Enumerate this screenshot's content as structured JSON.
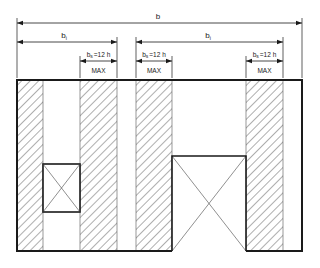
{
  "diagram": {
    "type": "wall-elevation-shear-panel-dimensions",
    "colors": {
      "line": "#1a1a1a",
      "background": "#ffffff",
      "hatch": "#333333"
    },
    "dimensions": {
      "overall": {
        "label": "b",
        "sub": ""
      },
      "left_bay": {
        "label": "b",
        "sub": "i"
      },
      "right_bay": {
        "label": "b",
        "sub": "i"
      },
      "panels": [
        {
          "label": "b",
          "sub": "s",
          "eq": "=12 h",
          "note": "MAX"
        },
        {
          "label": "b",
          "sub": "s",
          "eq": "=12 h",
          "note": "MAX"
        },
        {
          "label": "b",
          "sub": "s",
          "eq": "=12 h",
          "note": "MAX"
        }
      ]
    },
    "elements": {
      "hatched_columns": 4,
      "openings": [
        {
          "name": "window",
          "symbol": "crossed-rectangle"
        },
        {
          "name": "door",
          "symbol": "crossed-rectangle"
        }
      ]
    }
  }
}
